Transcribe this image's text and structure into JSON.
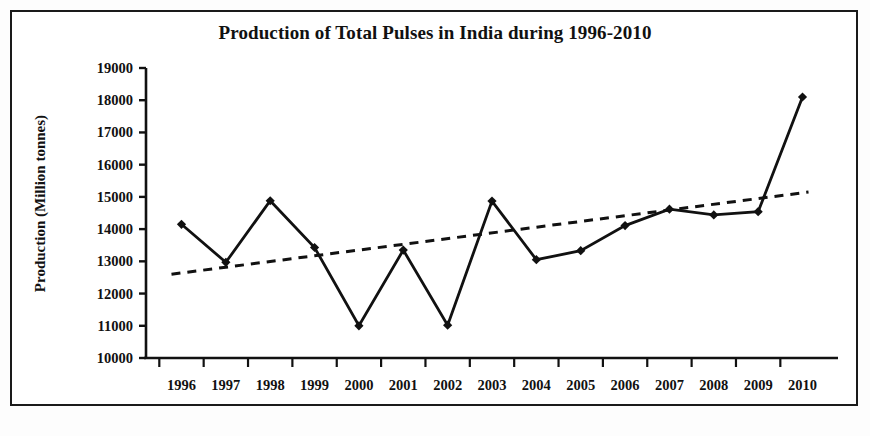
{
  "chart_data": {
    "type": "line",
    "title": "Production of Total Pulses in India during 1996-2010",
    "xlabel": "",
    "ylabel": "Production (Million tonnes)",
    "categories": [
      "1996",
      "1997",
      "1998",
      "1999",
      "2000",
      "2001",
      "2002",
      "2003",
      "2004",
      "2005",
      "2006",
      "2007",
      "2008",
      "2009",
      "2010"
    ],
    "series": [
      {
        "name": "Production",
        "style": "solid-line-with-diamond-markers",
        "values": [
          14150,
          12970,
          14880,
          13430,
          11000,
          13350,
          11020,
          14870,
          13050,
          13330,
          14110,
          14620,
          14440,
          14540,
          18100
        ]
      },
      {
        "name": "Linear trend",
        "style": "dashed-line",
        "values": [
          12600,
          12780,
          12960,
          13140,
          13320,
          13500,
          13680,
          13860,
          14040,
          14220,
          14400,
          14580,
          14760,
          14940,
          15150
        ]
      }
    ],
    "ylim": [
      10000,
      19000
    ],
    "yticks": [
      10000,
      11000,
      12000,
      13000,
      14000,
      15000,
      16000,
      17000,
      18000,
      19000
    ],
    "ytick_labels": [
      "10000",
      "11000",
      "12000",
      "13000",
      "14000",
      "15000",
      "16000",
      "17000",
      "18000",
      "19000"
    ],
    "grid": false,
    "legend": "none",
    "axis_color": "#111111",
    "line_color": "#111111",
    "trend_color": "#111111",
    "background_color": "#ffffff",
    "frame_color": "#1a1a1a"
  },
  "figure": {
    "title": "Production of Total Pulses in India during 1996-2010",
    "y_axis_title": "Production (Million tonnes)"
  }
}
